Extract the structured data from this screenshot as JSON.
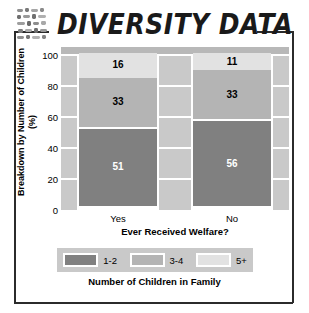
{
  "title": {
    "text": "DIVERSITY DATA",
    "icon": "mosaic-tiles-icon"
  },
  "frame": {
    "color": "#2b2b2b"
  },
  "chart_data": {
    "type": "bar",
    "subtype": "stacked-percentage",
    "title": "DIVERSITY DATA",
    "categories": [
      "Yes",
      "No"
    ],
    "xlabel": "Ever Received Welfare?",
    "ylabel": "Breakdown by Number of Children (%)",
    "ylim": [
      0,
      100
    ],
    "yticks": [
      0,
      20,
      40,
      60,
      80,
      100
    ],
    "grid": true,
    "legend_position": "bottom",
    "legend_title": "Number of Children in Family",
    "series": [
      {
        "name": "1-2",
        "values": [
          51,
          56
        ],
        "color": "#808080",
        "label_color": "#ffffff"
      },
      {
        "name": "3-4",
        "values": [
          33,
          33
        ],
        "color": "#b4b4b4",
        "label_color": "#000000"
      },
      {
        "name": "5+",
        "values": [
          16,
          11
        ],
        "color": "#e2e2e2",
        "label_color": "#000000"
      }
    ],
    "plot_background": "#c9c9c9",
    "gridline_color": "#ffffff"
  },
  "axis": {
    "yticks": [
      "100",
      "80",
      "60",
      "40",
      "20",
      "0"
    ],
    "xticks": [
      "Yes",
      "No"
    ]
  },
  "legend": {
    "title": "Number of Children in Family",
    "entries": [
      {
        "label": "1-2",
        "color": "#808080"
      },
      {
        "label": "3-4",
        "color": "#b4b4b4"
      },
      {
        "label": "5+",
        "color": "#e2e2e2"
      }
    ]
  }
}
